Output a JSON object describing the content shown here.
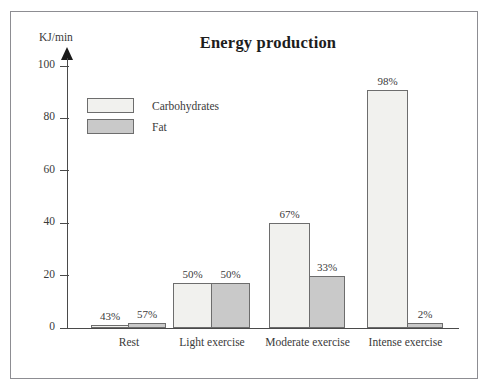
{
  "figure": {
    "title": "Energy production",
    "y_axis_label": "KJ/min"
  },
  "legend": {
    "items": [
      {
        "label": "Carbohydrates",
        "color": "#f1f1ee",
        "key": "carbohydrates"
      },
      {
        "label": "Fat",
        "color": "#c9c9c9",
        "key": "fat"
      }
    ]
  },
  "axis": {
    "y_ticks": [
      "0",
      "20",
      "40",
      "60",
      "80",
      "100"
    ]
  },
  "chart_data": {
    "type": "bar",
    "title": "Energy production",
    "xlabel": "",
    "ylabel": "KJ/min",
    "ylim": [
      0,
      100
    ],
    "yticks": [
      0,
      20,
      40,
      60,
      80,
      100
    ],
    "grid": false,
    "legend_position": "inside-top-left",
    "categories": [
      "Rest",
      "Light exercise",
      "Moderate exercise",
      "Intense exercise"
    ],
    "series": [
      {
        "name": "Carbohydrates",
        "color": "#f1f1ee",
        "values": [
          1,
          17,
          40,
          91
        ],
        "labels": [
          "43%",
          "50%",
          "67%",
          "98%"
        ]
      },
      {
        "name": "Fat",
        "color": "#c9c9c9",
        "values": [
          2,
          17,
          20,
          2
        ],
        "labels": [
          "57%",
          "50%",
          "33%",
          "2%"
        ]
      }
    ]
  }
}
